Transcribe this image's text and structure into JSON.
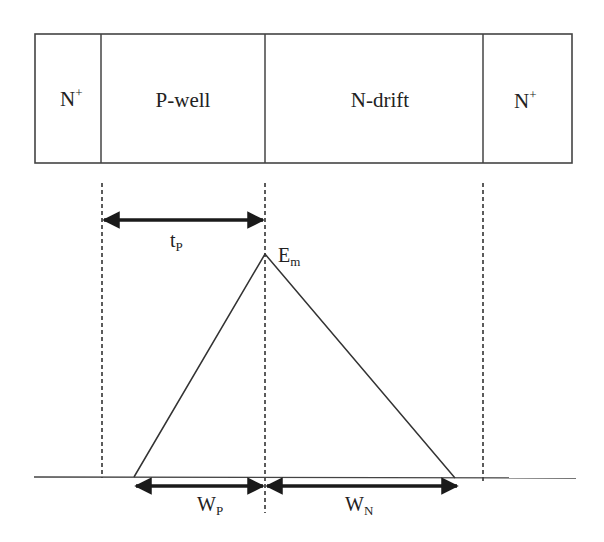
{
  "diagram": {
    "title": "",
    "regions": [
      {
        "id": "n-plus-left",
        "label": "N",
        "superscript": "+"
      },
      {
        "id": "p-well",
        "label": "P-well"
      },
      {
        "id": "n-drift",
        "label": "N-drift"
      },
      {
        "id": "n-plus-right",
        "label": "N",
        "superscript": "+"
      }
    ],
    "annotations": {
      "tp": {
        "main": "t",
        "sub": "P"
      },
      "em": {
        "main": "E",
        "sub": "m"
      },
      "wp": {
        "main": "W",
        "sub": "P"
      },
      "wn": {
        "main": "W",
        "sub": "N"
      }
    },
    "field_profile": {
      "shape": "triangle",
      "peak_label": "Em",
      "left_width_label": "WP",
      "right_width_label": "WN"
    },
    "colors": {
      "line": "#333333",
      "arrow": "#1a1a1a",
      "background": "#ffffff"
    }
  }
}
